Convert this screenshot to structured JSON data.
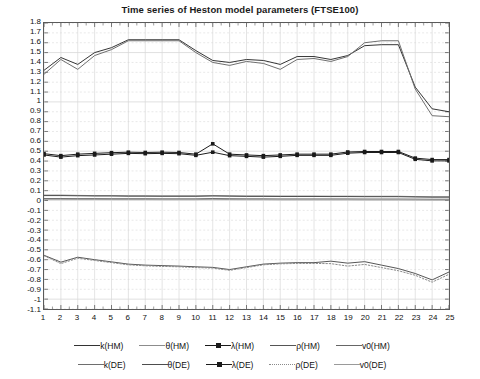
{
  "chart_data": {
    "type": "line",
    "title": "Time series of Heston model parameters (FTSE100)",
    "xlabel": "",
    "ylabel": "",
    "xlim": [
      1,
      25
    ],
    "ylim": [
      -1.1,
      1.8
    ],
    "grid": true,
    "legend_position": "bottom",
    "x": [
      1,
      2,
      3,
      4,
      5,
      6,
      7,
      8,
      9,
      10,
      11,
      12,
      13,
      14,
      15,
      16,
      17,
      18,
      19,
      20,
      21,
      22,
      23,
      24,
      25
    ],
    "xticks": [
      "1",
      "2",
      "3",
      "4",
      "5",
      "6",
      "7",
      "8",
      "9",
      "10",
      "11",
      "12",
      "13",
      "14",
      "15",
      "16",
      "17",
      "18",
      "19",
      "20",
      "21",
      "22",
      "23",
      "24",
      "25"
    ],
    "yticks": [
      "1.8",
      "1.7",
      "1.6",
      "1.5",
      "1.4",
      "1.3",
      "1.2",
      "1.1",
      "1",
      "0.9",
      "0.8",
      "0.7",
      "0.6",
      "0.5",
      "0.4",
      "0.3",
      "0.2",
      "0.1",
      "0",
      "-0.1",
      "-0.2",
      "-0.3",
      "-0.4",
      "-0.5",
      "-0.6",
      "-0.7",
      "-0.8",
      "-0.9",
      "-1",
      "-1.1"
    ],
    "series": [
      {
        "name": "k(HM)",
        "color": "#333333",
        "style": "solid",
        "marker": "none",
        "values": [
          1.32,
          1.45,
          1.38,
          1.5,
          1.55,
          1.63,
          1.63,
          1.63,
          1.63,
          1.52,
          1.42,
          1.4,
          1.43,
          1.42,
          1.38,
          1.46,
          1.46,
          1.43,
          1.47,
          1.57,
          1.58,
          1.58,
          1.15,
          0.93,
          0.9
        ]
      },
      {
        "name": "θ(HM)",
        "color": "#8c8c8c",
        "style": "solid",
        "marker": "none",
        "values": [
          0.055,
          0.055,
          0.052,
          0.05,
          0.05,
          0.048,
          0.048,
          0.047,
          0.047,
          0.047,
          0.05,
          0.048,
          0.046,
          0.046,
          0.045,
          0.045,
          0.045,
          0.044,
          0.044,
          0.043,
          0.043,
          0.043,
          0.04,
          0.038,
          0.038
        ]
      },
      {
        "name": "λ(HM)",
        "color": "#1a1a1a",
        "style": "solid",
        "marker": "square",
        "values": [
          0.475,
          0.455,
          0.47,
          0.478,
          0.485,
          0.49,
          0.487,
          0.49,
          0.487,
          0.47,
          0.575,
          0.47,
          0.462,
          0.455,
          0.462,
          0.47,
          0.47,
          0.47,
          0.492,
          0.497,
          0.497,
          0.497,
          0.43,
          0.415,
          0.415
        ]
      },
      {
        "name": "ρ(HM)",
        "color": "#555555",
        "style": "solid",
        "marker": "none",
        "values": [
          -0.555,
          -0.625,
          -0.575,
          -0.6,
          -0.622,
          -0.645,
          -0.655,
          -0.66,
          -0.665,
          -0.672,
          -0.678,
          -0.7,
          -0.672,
          -0.645,
          -0.635,
          -0.63,
          -0.63,
          -0.615,
          -0.635,
          -0.62,
          -0.655,
          -0.69,
          -0.74,
          -0.805,
          -0.725
        ]
      },
      {
        "name": "v0(HM)",
        "color": "#666666",
        "style": "solid",
        "marker": "none",
        "values": [
          0.02,
          0.02,
          0.019,
          0.019,
          0.018,
          0.018,
          0.018,
          0.017,
          0.017,
          0.017,
          0.02,
          0.018,
          0.017,
          0.017,
          0.016,
          0.016,
          0.016,
          0.016,
          0.016,
          0.015,
          0.015,
          0.015,
          0.014,
          0.013,
          0.013
        ]
      },
      {
        "name": "k(DE)",
        "color": "#6e6e6e",
        "style": "solid",
        "marker": "none",
        "values": [
          1.28,
          1.43,
          1.33,
          1.47,
          1.53,
          1.62,
          1.62,
          1.62,
          1.62,
          1.5,
          1.4,
          1.37,
          1.41,
          1.39,
          1.33,
          1.43,
          1.44,
          1.41,
          1.46,
          1.6,
          1.62,
          1.62,
          1.13,
          0.86,
          0.85
        ]
      },
      {
        "name": "θ(DE)",
        "color": "#4d4d4d",
        "style": "solid",
        "marker": "none",
        "values": [
          0.05,
          0.05,
          0.048,
          0.046,
          0.046,
          0.044,
          0.044,
          0.043,
          0.043,
          0.043,
          0.046,
          0.044,
          0.042,
          0.042,
          0.041,
          0.041,
          0.041,
          0.04,
          0.04,
          0.039,
          0.039,
          0.039,
          0.036,
          0.034,
          0.034
        ]
      },
      {
        "name": "λ(DE)",
        "color": "#1a1a1a",
        "style": "solid",
        "marker": "square",
        "values": [
          0.462,
          0.44,
          0.455,
          0.462,
          0.47,
          0.478,
          0.475,
          0.478,
          0.475,
          0.458,
          0.49,
          0.455,
          0.448,
          0.44,
          0.448,
          0.458,
          0.458,
          0.458,
          0.48,
          0.487,
          0.487,
          0.487,
          0.418,
          0.402,
          0.402
        ]
      },
      {
        "name": "ρ(DE)",
        "color": "#8a8a8a",
        "style": "dotted",
        "marker": "none",
        "values": [
          -0.56,
          -0.64,
          -0.585,
          -0.608,
          -0.63,
          -0.652,
          -0.662,
          -0.668,
          -0.672,
          -0.68,
          -0.685,
          -0.708,
          -0.68,
          -0.652,
          -0.642,
          -0.638,
          -0.638,
          -0.64,
          -0.665,
          -0.648,
          -0.68,
          -0.712,
          -0.758,
          -0.828,
          -0.748
        ]
      },
      {
        "name": "v0(DE)",
        "color": "#9a9a9a",
        "style": "solid",
        "marker": "none",
        "values": [
          0.012,
          0.012,
          0.011,
          0.011,
          0.01,
          0.01,
          0.01,
          0.009,
          0.009,
          0.009,
          0.012,
          0.01,
          0.009,
          0.009,
          0.008,
          0.008,
          0.008,
          0.008,
          0.008,
          0.007,
          0.007,
          0.007,
          0.006,
          0.005,
          0.005
        ]
      }
    ]
  },
  "legend": {
    "row1": [
      "k(HM)",
      "θ(HM)",
      "λ(HM)",
      "ρ(HM)",
      "v0(HM)"
    ],
    "row2": [
      "k(DE)",
      "θ(DE)",
      "λ(DE)",
      "ρ(DE)",
      "v0(DE)"
    ]
  },
  "colors": {
    "axis": "#5a5a5a",
    "grid": "#d8d8d8",
    "text": "#111111",
    "background": "#ffffff"
  }
}
